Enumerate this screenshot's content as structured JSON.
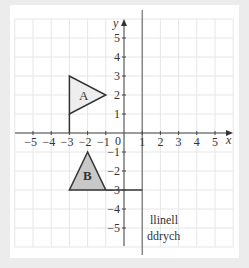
{
  "diagram": {
    "type": "coordinate-grid-reflection",
    "axes": {
      "x_label": "x",
      "y_label": "y",
      "x_ticks": [
        -5,
        -4,
        -3,
        -2,
        -1,
        1,
        2,
        3,
        4,
        5
      ],
      "x_tick_labels": [
        "−5",
        "−4",
        "−3",
        "−2",
        "−1",
        "1",
        "2",
        "3",
        "4",
        "5"
      ],
      "y_ticks": [
        5,
        4,
        3,
        2,
        1,
        -1,
        -2,
        -3,
        -4,
        -5
      ],
      "y_tick_labels": [
        "5",
        "4",
        "3",
        "2",
        "1",
        "−1",
        "−2",
        "−3",
        "−4",
        "−5"
      ],
      "origin_label": "0",
      "range_x": [
        -6,
        6
      ],
      "range_y": [
        -6,
        6
      ]
    },
    "shapes": [
      {
        "label": "A",
        "vertices": [
          [
            -3,
            3
          ],
          [
            -3,
            1
          ],
          [
            -1,
            2
          ]
        ],
        "fill": "#eeeeee",
        "stroke": "#333333"
      },
      {
        "label": "B",
        "vertices": [
          [
            -2,
            -1
          ],
          [
            -3,
            -3
          ],
          [
            -1,
            -3
          ]
        ],
        "fill": "#c8c8c8",
        "stroke": "#333333"
      }
    ],
    "mirror_line": {
      "equation": "x = 1",
      "label_line1": "llinell",
      "label_line2": "ddrych"
    },
    "extra_segments": [
      {
        "from": [
          -3,
          1
        ],
        "to": [
          -3,
          0
        ]
      },
      {
        "from": [
          -1,
          -3
        ],
        "to": [
          1,
          -3
        ]
      }
    ],
    "colors": {
      "background": "#ececec",
      "card": "#ffffff",
      "grid": "#e6e6e6",
      "axis": "#444444"
    }
  }
}
